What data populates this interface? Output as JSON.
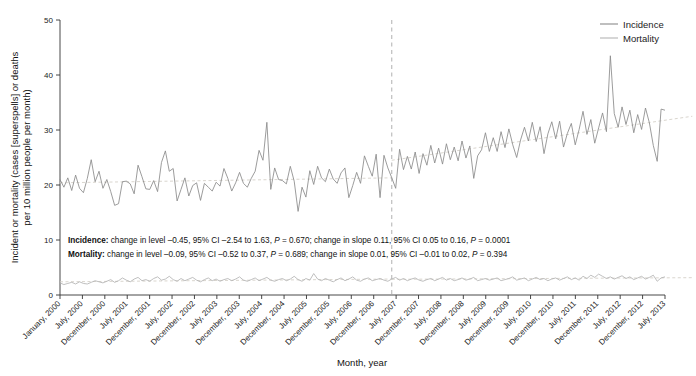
{
  "chart_data": {
    "type": "line",
    "title": "",
    "xlabel": "Month, year",
    "ylabel": "Incident or mortality (cases [superspells] or deaths per 10 million people per month)",
    "ylabel_line1": "Incident or mortality (cases [superspells] or deaths",
    "ylabel_line2": "per 10 million people per month)",
    "ylim": [
      0,
      50
    ],
    "yticks": [
      0,
      10,
      20,
      30,
      40,
      50
    ],
    "grid": false,
    "legend_position": "top-right",
    "x_start": "January, 2000",
    "x_end": "July, 2013",
    "xtick_labels": [
      "January, 2000",
      "July, 2000",
      "December, 2000",
      "July, 2001",
      "December, 2001",
      "July, 2002",
      "December, 2002",
      "July, 2003",
      "December, 2003",
      "July, 2004",
      "December, 2004",
      "July, 2005",
      "December, 2005",
      "July, 2006",
      "December, 2006",
      "July, 2007",
      "December, 2007",
      "July, 2008",
      "December, 2008",
      "July, 2009",
      "December, 2009",
      "July, 2010",
      "December, 2010",
      "July, 2011",
      "December, 2011",
      "July, 2012",
      "December, 2012",
      "July, 2013"
    ],
    "intervention_line": {
      "label": "",
      "x_index": 85,
      "style": "dashed",
      "color": "#b0b0b0"
    },
    "series": [
      {
        "name": "Incidence",
        "color": "#8a8a8a",
        "values": [
          21.0,
          19.6,
          21.3,
          19.0,
          21.8,
          19.4,
          18.6,
          21.2,
          24.6,
          20.6,
          22.5,
          19.4,
          21.0,
          18.8,
          16.3,
          16.6,
          20.6,
          20.7,
          20.2,
          18.4,
          23.6,
          21.5,
          19.3,
          19.2,
          20.8,
          18.8,
          24.1,
          26.2,
          22.5,
          23.0,
          17.1,
          19.2,
          21.3,
          18.0,
          19.9,
          20.4,
          17.2,
          20.3,
          19.6,
          18.9,
          20.5,
          19.8,
          23.0,
          21.2,
          18.9,
          20.4,
          22.3,
          20.3,
          19.6,
          21.2,
          22.5,
          26.3,
          24.5,
          31.4,
          19.2,
          23.1,
          21.0,
          20.8,
          20.2,
          23.4,
          20.7,
          15.2,
          19.6,
          17.8,
          22.6,
          20.1,
          23.4,
          21.3,
          20.6,
          22.9,
          21.1,
          20.3,
          22.2,
          23.1,
          17.7,
          19.9,
          22.3,
          20.3,
          25.3,
          23.4,
          21.6,
          25.6,
          17.7,
          25.4,
          23.1,
          21.3,
          19.4,
          26.5,
          22.8,
          25.2,
          22.9,
          26.0,
          22.1,
          25.7,
          23.6,
          27.2,
          24.0,
          26.7,
          23.8,
          27.5,
          24.6,
          26.9,
          24.4,
          28.0,
          24.9,
          27.1,
          21.2,
          25.3,
          26.4,
          29.5,
          26.1,
          28.6,
          26.1,
          29.7,
          26.8,
          30.2,
          27.3,
          25.0,
          28.2,
          30.5,
          28.0,
          31.4,
          27.9,
          30.6,
          25.7,
          29.3,
          31.5,
          28.4,
          31.6,
          26.9,
          29.4,
          31.2,
          27.3,
          30.1,
          33.4,
          29.2,
          31.9,
          27.6,
          30.4,
          33.1,
          29.7,
          43.5,
          33.0,
          30.5,
          34.2,
          31.0,
          33.6,
          29.5,
          32.8,
          30.1,
          34.0,
          31.3,
          27.2,
          24.3,
          33.8,
          33.6
        ]
      },
      {
        "name": "Mortality",
        "color": "#b4b4b4",
        "values": [
          2.2,
          1.9,
          2.1,
          2.3,
          2.0,
          2.4,
          2.1,
          2.0,
          2.3,
          2.6,
          2.4,
          2.2,
          2.5,
          2.8,
          2.3,
          2.6,
          3.1,
          2.7,
          2.4,
          2.9,
          3.2,
          2.6,
          2.8,
          2.5,
          3.0,
          3.3,
          2.7,
          2.9,
          3.4,
          2.8,
          2.5,
          3.0,
          2.6,
          2.9,
          3.2,
          2.7,
          2.4,
          2.8,
          3.1,
          2.6,
          2.9,
          2.5,
          2.8,
          3.0,
          2.6,
          2.9,
          3.3,
          2.7,
          2.5,
          2.8,
          3.1,
          2.6,
          2.9,
          3.2,
          2.7,
          2.5,
          2.8,
          3.0,
          2.6,
          2.9,
          3.4,
          2.8,
          2.5,
          3.0,
          2.7,
          3.9,
          2.9,
          2.6,
          3.0,
          2.7,
          2.4,
          2.8,
          3.1,
          2.6,
          2.9,
          3.3,
          2.7,
          2.5,
          2.9,
          3.1,
          2.6,
          2.8,
          3.0,
          2.7,
          2.5,
          2.9,
          3.2,
          2.7,
          3.0,
          2.6,
          2.9,
          3.1,
          2.7,
          2.5,
          2.8,
          3.0,
          2.6,
          2.9,
          3.2,
          2.7,
          3.0,
          2.6,
          2.8,
          3.1,
          2.7,
          2.9,
          3.2,
          2.6,
          2.8,
          3.0,
          2.7,
          2.9,
          3.1,
          2.6,
          2.8,
          3.0,
          3.3,
          2.7,
          2.9,
          3.1,
          2.6,
          2.9,
          3.2,
          2.8,
          3.0,
          2.6,
          2.9,
          3.1,
          2.7,
          3.0,
          3.3,
          2.8,
          3.1,
          2.7,
          3.4,
          3.0,
          3.6,
          3.2,
          3.8,
          3.4,
          3.0,
          3.3,
          2.9,
          3.2,
          3.5,
          3.0,
          3.3,
          2.8,
          3.1,
          3.4,
          2.9,
          3.2,
          3.6,
          2.5,
          3.1,
          3.3
        ]
      }
    ],
    "trend_lines": [
      {
        "name": "incidence-trend",
        "color": "#d5d0c8",
        "style": "dashed",
        "segments": [
          {
            "x0": 0,
            "y0": 20.4,
            "x1": 85,
            "y1": 21.3
          },
          {
            "x0": 85,
            "y0": 24.5,
            "x1": 162,
            "y1": 32.5
          }
        ]
      },
      {
        "name": "mortality-trend",
        "color": "#d5d0c8",
        "style": "dashed",
        "segments": [
          {
            "x0": 0,
            "y0": 2.4,
            "x1": 85,
            "y1": 2.9
          },
          {
            "x0": 85,
            "y0": 2.85,
            "x1": 162,
            "y1": 3.15
          }
        ]
      }
    ]
  },
  "legend": {
    "items": [
      {
        "label": "Incidence",
        "color": "#8a8a8a"
      },
      {
        "label": "Mortality",
        "color": "#b4b4b4"
      }
    ]
  },
  "annotations": {
    "incidence": {
      "prefix": "Incidence:",
      "text_a": " change in level –0.45, 95% CI –2.54 to 1.63, ",
      "p1": "P",
      "text_b": " = 0.670; change in slope 0.11, 95% CI 0.05 to 0.16, ",
      "p2": "P",
      "text_c": " = 0.0001"
    },
    "mortality": {
      "prefix": "Mortality:",
      "text_a": " change in level –0.09, 95% CI –0.52 to 0.37, ",
      "p1": "P",
      "text_b": " = 0.689; change in slope 0.01, 95% CI –0.01 to 0.02, ",
      "p2": "P",
      "text_c": " = 0.394"
    }
  }
}
